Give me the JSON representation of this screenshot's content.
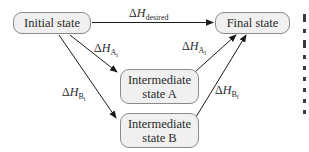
{
  "diagram": {
    "type": "enthalpy-path-diagram",
    "nodes": {
      "initial": {
        "label": "Initial state"
      },
      "final": {
        "label": "Final state"
      },
      "intermediate_a": {
        "label": "Intermediate\nstate A"
      },
      "intermediate_b": {
        "label": "Intermediate\nstate B"
      }
    },
    "edges": {
      "desired": {
        "from": "Initial state",
        "to": "Final state",
        "delta": "Δ",
        "symbol": "H",
        "subscript": "desired",
        "subsubscript": ""
      },
      "a_initial": {
        "from": "Initial state",
        "to": "Intermediate state A",
        "delta": "Δ",
        "symbol": "H",
        "subscript": "A",
        "subsubscript": "i"
      },
      "b_initial": {
        "from": "Initial state",
        "to": "Intermediate state B",
        "delta": "Δ",
        "symbol": "H",
        "subscript": "B",
        "subsubscript": "i"
      },
      "a_final": {
        "from": "Intermediate state A",
        "to": "Final state",
        "delta": "Δ",
        "symbol": "H",
        "subscript": "A",
        "subsubscript": "f"
      },
      "b_final": {
        "from": "Intermediate state B",
        "to": "Final state",
        "delta": "Δ",
        "symbol": "H",
        "subscript": "B",
        "subsubscript": "f"
      }
    },
    "colors": {
      "box_fill": "#f0f0f0",
      "box_border": "#8a8a8a",
      "arrow": "#1a1a1a",
      "text": "#2a2a2a"
    }
  }
}
